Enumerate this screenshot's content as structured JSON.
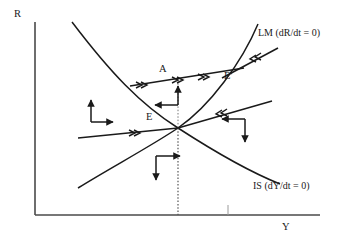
{
  "figure": {
    "type": "phase-diagram",
    "title": "",
    "background_color": "#ffffff",
    "line_color": "#1a1a1a"
  },
  "axes": {
    "y_axis_label": "R",
    "x_axis_label": "Y",
    "origin": [
      35,
      215
    ],
    "y_top": [
      35,
      22
    ],
    "x_right": [
      320,
      215
    ]
  },
  "curves": [
    {
      "name": "IS",
      "label": "IS (dY/dt = 0)",
      "slope": "downward",
      "description": "downward-sloping convex curve from upper-left to lower-right"
    },
    {
      "name": "LM",
      "label": "LM (dR/dt = 0)",
      "slope": "upward",
      "description": "upward-sloping convex curve from lower-left to upper-right"
    }
  ],
  "points": [
    {
      "name": "E",
      "label": "E",
      "description": "initial equilibrium at curve intersection"
    },
    {
      "name": "A",
      "label": "A",
      "description": "point on adjustment trajectory above equilibrium"
    },
    {
      "name": "E-prime",
      "label": "E'",
      "description": "new equilibrium on LM curve"
    }
  ],
  "trajectories": [
    {
      "name": "upper-saddle-path",
      "direction": "rightward toward E'",
      "arrow_markers": 3,
      "passes_through": [
        "A",
        "E'"
      ]
    },
    {
      "name": "lower-saddle-path",
      "direction": "rightward toward E",
      "arrow_markers": 1,
      "passes_through": [
        "E"
      ]
    },
    {
      "name": "incoming-upper-right",
      "direction": "leftward toward E'",
      "arrow_markers": 1
    },
    {
      "name": "incoming-lower-right",
      "direction": "leftward toward E",
      "arrow_markers": 1
    }
  ],
  "quadrant_arrows": [
    {
      "name": "north-quadrant",
      "horizontal": "left",
      "vertical": "up"
    },
    {
      "name": "west-quadrant",
      "horizontal": "right",
      "vertical": "up"
    },
    {
      "name": "east-quadrant",
      "horizontal": "left",
      "vertical": "down"
    },
    {
      "name": "south-quadrant",
      "horizontal": "right",
      "vertical": "down"
    }
  ],
  "guides": [
    {
      "name": "equilibrium-dropline",
      "style": "dotted",
      "from": "equilibrium",
      "to": "x-axis"
    }
  ]
}
